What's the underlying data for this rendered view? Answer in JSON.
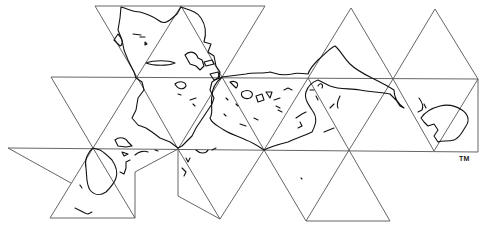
{
  "map": {
    "title": "Dymaxion (Fuller) icosahedral world map projection",
    "projection": "icosahedron net",
    "trademark": "TM",
    "colors": {
      "background": "#ffffff",
      "grid": "#555555",
      "coastline": "#111111"
    },
    "landmasses_visible": [
      "North America",
      "South America",
      "Europe",
      "Africa",
      "Asia",
      "Australia",
      "Antarctica",
      "Greenland"
    ]
  }
}
